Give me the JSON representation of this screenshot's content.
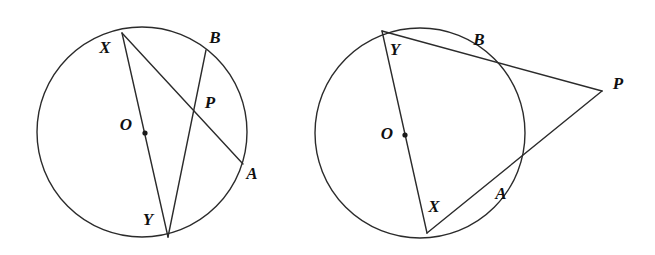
{
  "page": {
    "width": 655,
    "height": 255,
    "background_color": "#ffffff"
  },
  "style": {
    "stroke_color": "#2b2b2b",
    "label_color": "#101010",
    "stroke_width": 1.4,
    "label_font_size": 17
  },
  "figures": [
    {
      "id": "left-figure",
      "name": "secants-intersecting-inside-circle",
      "circle": {
        "cx": 142,
        "cy": 132,
        "r": 105
      },
      "center": {
        "label": "O",
        "dot": {
          "x": 145,
          "y": 133
        },
        "label_pos": {
          "x": 126,
          "y": 126
        }
      },
      "points": [
        {
          "id": "X",
          "label": "X",
          "x": 122,
          "y": 33,
          "label_pos": {
            "x": 105,
            "y": 49
          }
        },
        {
          "id": "B",
          "label": "B",
          "x": 206,
          "y": 50,
          "label_pos": {
            "x": 215,
            "y": 39
          }
        },
        {
          "id": "P",
          "label": "P",
          "x": 196,
          "y": 114,
          "label_pos": {
            "x": 210,
            "y": 104
          }
        },
        {
          "id": "A",
          "label": "A",
          "x": 243,
          "y": 164,
          "label_pos": {
            "x": 252,
            "y": 175
          }
        },
        {
          "id": "Y",
          "label": "Y",
          "x": 168,
          "y": 237,
          "label_pos": {
            "x": 148,
            "y": 221
          }
        }
      ],
      "segments": [
        {
          "id": "XY",
          "name": "chord-x-y",
          "from": "X",
          "to": "Y"
        },
        {
          "id": "XA",
          "name": "chord-x-a",
          "from": "X",
          "to": "A"
        },
        {
          "id": "BY",
          "name": "chord-b-y",
          "from": "B",
          "to": "Y"
        }
      ]
    },
    {
      "id": "right-figure",
      "name": "secants-intersecting-outside-circle",
      "circle": {
        "cx": 420,
        "cy": 133,
        "r": 105
      },
      "center": {
        "label": "O",
        "dot": {
          "x": 405,
          "y": 135
        },
        "label_pos": {
          "x": 387,
          "y": 135
        }
      },
      "points": [
        {
          "id": "Y",
          "label": "Y",
          "x": 382,
          "y": 31,
          "label_pos": {
            "x": 395,
            "y": 51
          }
        },
        {
          "id": "B",
          "label": "B",
          "x": 470,
          "y": 53,
          "label_pos": {
            "x": 479,
            "y": 41
          }
        },
        {
          "id": "P",
          "label": "P",
          "x": 602,
          "y": 91,
          "label_pos": {
            "x": 618,
            "y": 85
          }
        },
        {
          "id": "A",
          "label": "A",
          "x": 493,
          "y": 182,
          "label_pos": {
            "x": 501,
            "y": 195
          }
        },
        {
          "id": "X",
          "label": "X",
          "x": 427,
          "y": 233,
          "label_pos": {
            "x": 434,
            "y": 208
          }
        }
      ],
      "segments": [
        {
          "id": "YX",
          "name": "diameter-y-x",
          "from": "Y",
          "to": "X"
        },
        {
          "id": "YP",
          "name": "secant-y-b-p",
          "from": "Y",
          "to": "P"
        },
        {
          "id": "XP",
          "name": "secant-x-a-p",
          "from": "X",
          "to": "P"
        }
      ]
    }
  ]
}
